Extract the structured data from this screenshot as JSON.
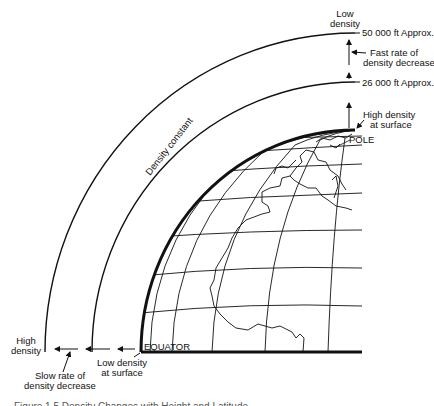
{
  "diagram": {
    "title": "Density changes with height and latitude",
    "labels": {
      "low_density_top_1": "Low",
      "low_density_top_2": "density",
      "alt_50000": "50 000 ft Approx.",
      "fast_rate_1": "Fast rate of",
      "fast_rate_2": "density decrease",
      "alt_26000": "26 000 ft Approx.",
      "high_density_surface_1": "High density",
      "high_density_surface_2": "at surface",
      "pole": "POLE",
      "density_constant": "Density constant",
      "high_density_left_1": "High",
      "high_density_left_2": "density",
      "slow_rate_1": "Slow rate of",
      "slow_rate_2": "density decrease",
      "low_density_surface_1": "Low density",
      "low_density_surface_2": "at surface",
      "equator": "EQUATOR"
    },
    "caption": "Figure 1.5 Density Changes with Height and Latitude"
  }
}
